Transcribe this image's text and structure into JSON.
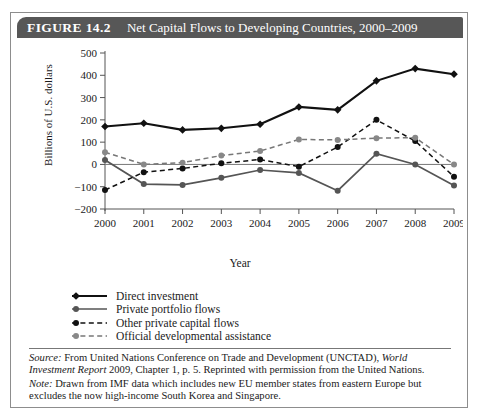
{
  "figure": {
    "number_label": "FIGURE 14.2",
    "title": "Net Capital Flows to Developing Countries, 2000–2009",
    "source": {
      "label": "Source:",
      "text_a": " From United Nations Conference on Trade and Development (UNCTAD), ",
      "italic_a": "World Investment Report",
      "text_b": " 2009, Chapter 1, p. 5. Reprinted with permission from the United Nations."
    },
    "note": {
      "label": "Note:",
      "text": " Drawn from IMF data which includes new EU member states from eastern Europe but excludes the now high-income South Korea and Singapore."
    }
  },
  "chart_data": {
    "type": "line",
    "title": "Net Capital Flows to Developing Countries, 2000–2009",
    "xlabel": "Year",
    "ylabel": "Billions of U.S. dollars",
    "categories": [
      "2000",
      "2001",
      "2002",
      "2003",
      "2004",
      "2005",
      "2006",
      "2007",
      "2008",
      "2009"
    ],
    "x": [
      2000,
      2001,
      2002,
      2003,
      2004,
      2005,
      2006,
      2007,
      2008,
      2009
    ],
    "ylim": [
      -200,
      500
    ],
    "yticks": [
      -200,
      -100,
      0,
      100,
      200,
      300,
      400,
      500
    ],
    "ytick_labels": [
      "−200",
      "−100",
      "0",
      "100",
      "200",
      "300",
      "400",
      "500"
    ],
    "grid": false,
    "legend_position": "below-left",
    "series": [
      {
        "name": "Direct investment",
        "style": "solid-dark",
        "values": [
          170,
          185,
          155,
          162,
          180,
          258,
          245,
          375,
          430,
          405
        ]
      },
      {
        "name": "Private portfolio flows",
        "style": "solid-gray",
        "values": [
          20,
          -88,
          -92,
          -60,
          -25,
          -38,
          -118,
          48,
          0,
          -95
        ]
      },
      {
        "name": "Other private capital flows",
        "style": "dashed-dark",
        "values": [
          -115,
          -35,
          -18,
          5,
          22,
          -10,
          78,
          200,
          105,
          -55
        ]
      },
      {
        "name": "Official developmental assistance",
        "style": "dashed-gray",
        "values": [
          55,
          0,
          8,
          40,
          60,
          112,
          110,
          118,
          120,
          0
        ]
      }
    ]
  },
  "legend": [
    {
      "label": "Direct investment"
    },
    {
      "label": "Private portfolio flows"
    },
    {
      "label": "Other private capital flows"
    },
    {
      "label": "Official developmental assistance"
    }
  ]
}
